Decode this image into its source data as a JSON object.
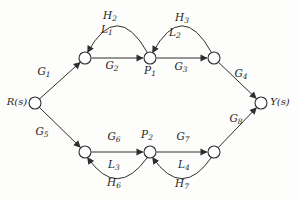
{
  "diagram": {
    "type": "signal-flow-graph",
    "input_node": "R(s)",
    "output_node": "Y(s)",
    "summary_nodes": [
      "R(s)",
      "n1",
      "P1",
      "n2",
      "n3",
      "P2",
      "n4",
      "Y(s)"
    ],
    "edges": [
      {
        "from": "R(s)",
        "to": "n1",
        "gain": "G1"
      },
      {
        "from": "n1",
        "to": "P1",
        "gain": "G2"
      },
      {
        "from": "P1",
        "to": "n2",
        "gain": "G3"
      },
      {
        "from": "n2",
        "to": "Y(s)",
        "gain": "G4"
      },
      {
        "from": "R(s)",
        "to": "n3",
        "gain": "G5"
      },
      {
        "from": "n3",
        "to": "P2",
        "gain": "G6"
      },
      {
        "from": "P2",
        "to": "n4",
        "gain": "G7"
      },
      {
        "from": "n4",
        "to": "Y(s)",
        "gain": "G8"
      },
      {
        "from": "P1",
        "to": "n1",
        "gain": "H2",
        "loop": "L1"
      },
      {
        "from": "n2",
        "to": "P1",
        "gain": "H3",
        "loop": "L2"
      },
      {
        "from": "P2",
        "to": "n3",
        "gain": "H6",
        "loop": "L3"
      },
      {
        "from": "n4",
        "to": "P2",
        "gain": "H7",
        "loop": "L4"
      }
    ],
    "colors": {
      "line": "#2e2e2e",
      "text": "#1f1f1f",
      "background": "#fdfdfc",
      "node_fill": "#ffffff"
    }
  },
  "labels": {
    "R": {
      "main": "R(s)",
      "sub": ""
    },
    "Y": {
      "main": "Y(s)",
      "sub": ""
    },
    "P1": {
      "main": "P",
      "sub": "1"
    },
    "P2": {
      "main": "P",
      "sub": "2"
    },
    "G1": {
      "main": "G",
      "sub": "1"
    },
    "G2": {
      "main": "G",
      "sub": "2"
    },
    "G3": {
      "main": "G",
      "sub": "3"
    },
    "G4": {
      "main": "G",
      "sub": "4"
    },
    "G5": {
      "main": "G",
      "sub": "5"
    },
    "G6": {
      "main": "G",
      "sub": "6"
    },
    "G7": {
      "main": "G",
      "sub": "7"
    },
    "G8": {
      "main": "G",
      "sub": "8"
    },
    "H2": {
      "main": "H",
      "sub": "2"
    },
    "H3": {
      "main": "H",
      "sub": "3"
    },
    "H6": {
      "main": "H",
      "sub": "6"
    },
    "H7": {
      "main": "H",
      "sub": "7"
    },
    "L1": {
      "main": "L",
      "sub": "1"
    },
    "L2": {
      "main": "L",
      "sub": "2"
    },
    "L3": {
      "main": "L",
      "sub": "3"
    },
    "L4": {
      "main": "L",
      "sub": "4"
    }
  }
}
